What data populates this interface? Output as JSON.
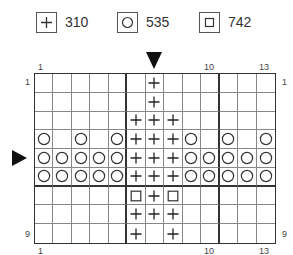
{
  "legend": [
    {
      "symbol": "plus",
      "icon": "plus-icon",
      "label": "310"
    },
    {
      "symbol": "circle",
      "icon": "circle-icon",
      "label": "535"
    },
    {
      "symbol": "square",
      "icon": "square-icon",
      "label": "742"
    }
  ],
  "axis": {
    "top_left": "1",
    "top_mid": "10",
    "top_right": "13",
    "bottom_left": "1",
    "bottom_mid": "10",
    "bottom_right": "13",
    "left_top": "1",
    "left_bottom": "9",
    "right_top": "1",
    "right_bottom": "9"
  },
  "markers": {
    "top_arrow_column": 7,
    "side_arrow_row": 5
  },
  "chart_data": {
    "type": "table",
    "columns": 13,
    "rows": 9,
    "legend": {
      "+": "310",
      "O": "535",
      "□": "742"
    },
    "grid": [
      [
        ".",
        ".",
        ".",
        ".",
        ".",
        ".",
        "+",
        ".",
        ".",
        ".",
        ".",
        ".",
        "."
      ],
      [
        ".",
        ".",
        ".",
        ".",
        ".",
        ".",
        "+",
        ".",
        ".",
        ".",
        ".",
        ".",
        "."
      ],
      [
        ".",
        ".",
        ".",
        ".",
        ".",
        "+",
        "+",
        "+",
        ".",
        ".",
        ".",
        ".",
        "."
      ],
      [
        "O",
        ".",
        "O",
        ".",
        "O",
        "+",
        "+",
        "+",
        "O",
        ".",
        "O",
        ".",
        "O"
      ],
      [
        "O",
        "O",
        "O",
        "O",
        "O",
        "+",
        "+",
        "+",
        "O",
        "O",
        "O",
        "O",
        "O"
      ],
      [
        "O",
        "O",
        "O",
        "O",
        "O",
        "+",
        "+",
        "+",
        "O",
        "O",
        "O",
        "O",
        "O"
      ],
      [
        ".",
        ".",
        ".",
        ".",
        ".",
        "□",
        "+",
        "□",
        ".",
        ".",
        ".",
        ".",
        "."
      ],
      [
        ".",
        ".",
        ".",
        ".",
        ".",
        "+",
        "+",
        "+",
        ".",
        ".",
        ".",
        ".",
        "."
      ],
      [
        ".",
        ".",
        ".",
        ".",
        ".",
        "+",
        ".",
        "+",
        ".",
        ".",
        ".",
        ".",
        "."
      ]
    ],
    "xlabel": "",
    "ylabel": "",
    "center_column_marker": 7,
    "center_row_marker": 5
  }
}
